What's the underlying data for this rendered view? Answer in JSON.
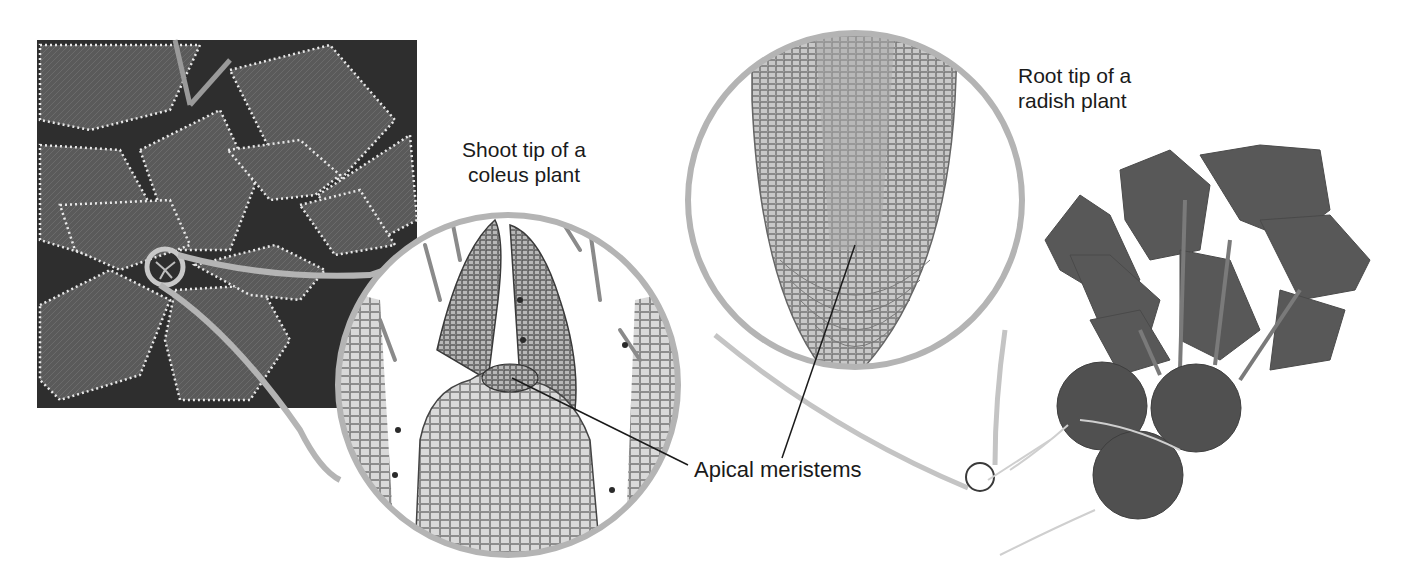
{
  "figure": {
    "topic": "Apical meristems in shoot and root tips",
    "color_mode": "grayscale",
    "colors": {
      "magnifier_ring": "#b4b4b4",
      "leader_line": "#1a1a1a",
      "label_text": "#1a1a1a",
      "photo_dark": "#3a3a3a",
      "photo_mid": "#6e6e6e",
      "leaf_edge": "#e6e6e6",
      "micrograph_cell": "#8a8a8a",
      "background": "#ffffff"
    }
  },
  "panels": {
    "coleus_photo": {
      "name": "Coleus plant photograph"
    },
    "shoot_tip_micrograph": {
      "name": "Shoot tip micrograph"
    },
    "root_tip_micrograph": {
      "name": "Root tip micrograph"
    },
    "radish_photo": {
      "name": "Radish plant photograph"
    }
  },
  "labels": {
    "shoot_tip": {
      "line1": "Shoot tip of a",
      "line2": "coleus plant"
    },
    "root_tip": {
      "line1": "Root tip of a",
      "line2": "radish plant"
    },
    "apical_meristems": "Apical meristems"
  }
}
